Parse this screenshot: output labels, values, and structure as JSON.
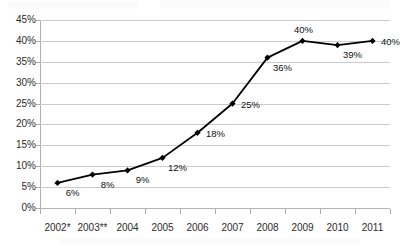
{
  "chart_data": {
    "type": "line",
    "title": "",
    "subtitle": "",
    "xlabel": "",
    "ylabel": "",
    "categories": [
      "2002*",
      "2003**",
      "2004",
      "2005",
      "2006",
      "2007",
      "2008",
      "2009",
      "2010",
      "2011"
    ],
    "values": [
      6,
      8,
      9,
      12,
      18,
      25,
      36,
      40,
      39,
      40
    ],
    "point_labels": [
      "6%",
      "8%",
      "9%",
      "12%",
      "18%",
      "25%",
      "36%",
      "40%",
      "39%",
      "40%"
    ],
    "ylim": [
      0,
      45
    ],
    "ytick_step": 5,
    "ytick_labels": [
      "0%",
      "5%",
      "10%",
      "15%",
      "20%",
      "25%",
      "30%",
      "35%",
      "40%",
      "45%"
    ],
    "ytick_values": [
      0,
      5,
      10,
      15,
      20,
      25,
      30,
      35,
      40,
      45
    ],
    "grid": true,
    "legend": "none",
    "series": [
      {
        "name": "",
        "values": [
          6,
          8,
          9,
          12,
          18,
          25,
          36,
          40,
          39,
          40
        ],
        "marker": "diamond",
        "line_color": "#000000",
        "marker_color": "#000000"
      }
    ],
    "label_positions": [
      "below-right",
      "below-right",
      "below-right",
      "below-right",
      "right",
      "right",
      "below-right",
      "above",
      "below-right",
      "right"
    ],
    "colors": {
      "line": "#000000",
      "marker": "#000000",
      "grid": "#cbcbcb",
      "axis": "#b0b0b0",
      "text": "#2b2b2b",
      "background": "#ffffff"
    },
    "annotations": {
      "footnote_markers": [
        "*",
        "**"
      ]
    }
  }
}
